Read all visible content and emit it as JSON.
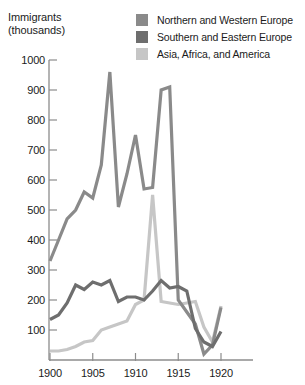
{
  "axis_caption": {
    "line1": "Immigrants",
    "line2": "(thousands)"
  },
  "legend": {
    "items": [
      {
        "label": "Northern and Western Europe",
        "color": "#8a8a8a",
        "swatch_name": "legend-swatch-northern-western-europe"
      },
      {
        "label": "Southern and Eastern Europe",
        "color": "#6e6e6e",
        "swatch_name": "legend-swatch-southern-eastern-europe"
      },
      {
        "label": "Asia, Africa, and America",
        "color": "#c6c6c6",
        "swatch_name": "legend-swatch-asia-africa-america"
      }
    ]
  },
  "y_ticks": [
    "1000",
    "900",
    "800",
    "700",
    "600",
    "500",
    "400",
    "300",
    "200",
    "100"
  ],
  "x_ticks": [
    "1900",
    "1905",
    "1910",
    "1915",
    "1920"
  ],
  "chart_data": {
    "type": "line",
    "title": "Immigrants (thousands)",
    "xlabel": "",
    "ylabel": "Immigrants (thousands)",
    "xlim": [
      1900,
      1920
    ],
    "ylim": [
      0,
      1000
    ],
    "y_tick_values": [
      100,
      200,
      300,
      400,
      500,
      600,
      700,
      800,
      900,
      1000
    ],
    "x_tick_values": [
      1900,
      1905,
      1910,
      1915,
      1920
    ],
    "grid": false,
    "legend_position": "top-right",
    "x": [
      1900,
      1901,
      1902,
      1903,
      1904,
      1905,
      1906,
      1907,
      1908,
      1909,
      1910,
      1911,
      1912,
      1913,
      1914,
      1915,
      1916,
      1917,
      1918,
      1919,
      1920
    ],
    "series": [
      {
        "name": "Northern and Western Europe",
        "color": "#8a8a8a",
        "values": [
          330,
          400,
          470,
          500,
          560,
          540,
          650,
          960,
          510,
          620,
          750,
          570,
          575,
          900,
          910,
          200,
          160,
          120,
          20,
          50,
          175
        ]
      },
      {
        "name": "Southern and Eastern Europe",
        "color": "#6e6e6e",
        "values": [
          135,
          150,
          190,
          250,
          235,
          260,
          250,
          265,
          195,
          210,
          210,
          200,
          230,
          265,
          240,
          245,
          230,
          105,
          60,
          45,
          95
        ]
      },
      {
        "name": "Asia, Africa, and America",
        "color": "#c6c6c6",
        "values": [
          30,
          30,
          35,
          45,
          60,
          65,
          100,
          110,
          120,
          130,
          185,
          200,
          550,
          195,
          190,
          185,
          190,
          195,
          110,
          60,
          180
        ]
      }
    ]
  }
}
